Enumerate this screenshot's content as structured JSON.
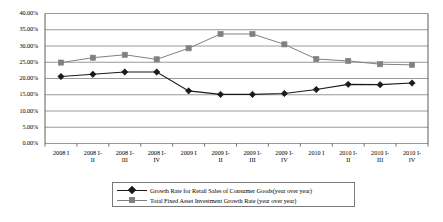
{
  "chart_data": {
    "type": "line",
    "title": "",
    "subtitle": "",
    "xlabel": "",
    "ylabel": "",
    "ylim": [
      0,
      40
    ],
    "y_ticks": [
      0,
      5,
      10,
      15,
      20,
      25,
      30,
      35,
      40
    ],
    "y_tick_labels": [
      "0.00%",
      "5.00%",
      "10.00%",
      "15.00%",
      "20.00%",
      "25.00%",
      "30.00%",
      "35.00%",
      "40.00%"
    ],
    "grid": true,
    "legend_position": "bottom",
    "categories": [
      "2008 I",
      "2008 I-II",
      "2008 I-III",
      "2008 I-IV",
      "2009 I",
      "2009 I-II",
      "2009 I-III",
      "2009 I-IV",
      "2010 I",
      "2010 I-II",
      "2010 I-III",
      "2010 I-IV"
    ],
    "category_lines": [
      [
        "2008 I",
        ""
      ],
      [
        "2008 I-",
        "II"
      ],
      [
        "2008 I-",
        "III"
      ],
      [
        "2008 I-",
        "IV"
      ],
      [
        "2009 I",
        ""
      ],
      [
        "2009 I-",
        "II"
      ],
      [
        "2009 I-",
        "III"
      ],
      [
        "2009 I-",
        "IV"
      ],
      [
        "2010 I",
        ""
      ],
      [
        "2010 I-",
        "II"
      ],
      [
        "2010 I-",
        "III"
      ],
      [
        "2010 I-",
        "IV"
      ]
    ],
    "series": [
      {
        "name": "Growth Rate for Retail Sales of Consumer Goods(year over year)",
        "marker": "diamond",
        "color": "#1a1a1a",
        "values": [
          20.6,
          21.3,
          22.0,
          22.0,
          16.2,
          15.1,
          15.1,
          15.4,
          16.6,
          18.2,
          18.1,
          18.6
        ]
      },
      {
        "name": "Total Fixed Asset Investment Growth Rate (year over year)",
        "marker": "square",
        "color": "#808080",
        "values": [
          24.9,
          26.4,
          27.3,
          25.9,
          29.3,
          33.7,
          33.7,
          30.5,
          26.0,
          25.4,
          24.4,
          24.2
        ]
      }
    ]
  },
  "legend": {
    "entries": [
      {
        "label": "Growth Rate for Retail Sales of Consumer Goods(year over year)"
      },
      {
        "label": "Total Fixed Asset Investment Growth Rate (year over year)"
      }
    ]
  },
  "colors": {
    "series_1": "#1a1a1a",
    "series_2": "#808080",
    "grid": "#808080",
    "axis": "#4d4d4d",
    "background": "#ffffff"
  }
}
